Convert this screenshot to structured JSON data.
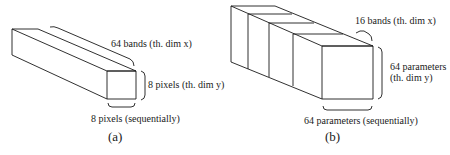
{
  "figures": [
    {
      "id": "a",
      "caption": "(a)",
      "labels": {
        "depth": "64 bands (th. dim x)",
        "height": "8 pixels (th. dim y)",
        "width": "8 pixels (sequentially)"
      }
    },
    {
      "id": "b",
      "caption": "(b)",
      "labels": {
        "depth": "16 bands (th. dim x)",
        "height_line1": "64 parameters",
        "height_line2": "(th. dim y)",
        "width": "64 parameters (sequentially)"
      }
    }
  ],
  "colors": {
    "stroke": "#1a1a1a",
    "background": "#ffffff"
  }
}
